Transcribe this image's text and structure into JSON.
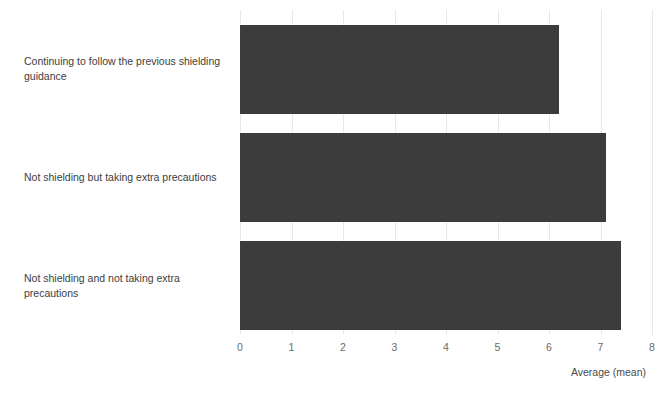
{
  "chart_data": {
    "type": "bar",
    "orientation": "horizontal",
    "title": "",
    "xlabel": "Average (mean)",
    "ylabel": "",
    "categories": [
      "Continuing to follow the previous shielding guidance",
      "Not shielding but taking extra precautions",
      "Not shielding and not taking extra precautions"
    ],
    "values": [
      6.2,
      7.1,
      7.4
    ],
    "xlim": [
      0,
      8
    ],
    "xticks": [
      "0",
      "1",
      "2",
      "3",
      "4",
      "5",
      "6",
      "7",
      "8"
    ],
    "grid": true,
    "legend": false,
    "bar_color": "#3c3c3c",
    "gridline_color": "#e9e9e9",
    "text_color": "#3d3d3d",
    "tick_color": "#6b6b6b",
    "background": "#ffffff"
  }
}
